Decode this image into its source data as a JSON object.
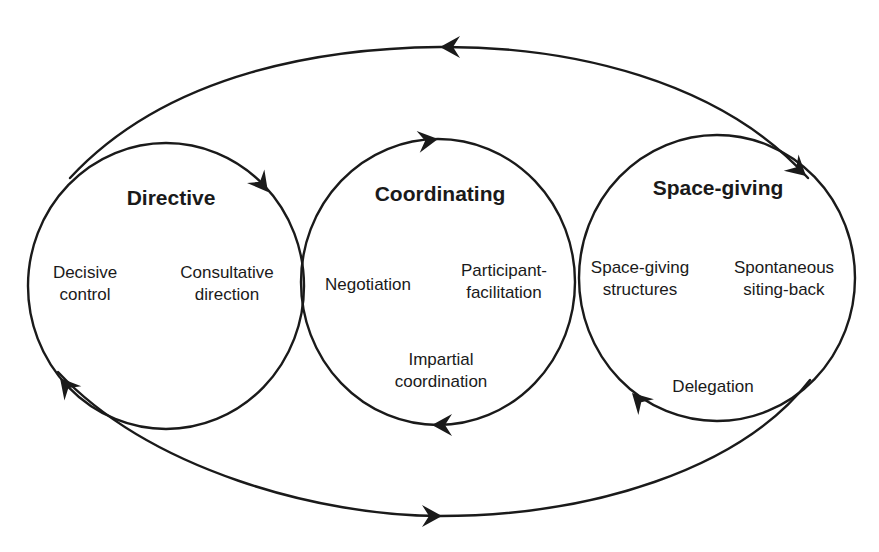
{
  "diagram": {
    "type": "leadership-style-cycle",
    "styles": [
      {
        "id": "directive",
        "title": "Directive",
        "items": [
          {
            "lines": [
              "Decisive",
              "control"
            ]
          },
          {
            "lines": [
              "Consultative",
              "direction"
            ]
          }
        ]
      },
      {
        "id": "coordinating",
        "title": "Coordinating",
        "items": [
          {
            "lines": [
              "Negotiation"
            ]
          },
          {
            "lines": [
              "Participant-",
              "facilitation"
            ]
          },
          {
            "lines": [
              "Impartial",
              "coordination"
            ]
          }
        ]
      },
      {
        "id": "space-giving",
        "title": "Space-giving",
        "items": [
          {
            "lines": [
              "Space-giving",
              "structures"
            ]
          },
          {
            "lines": [
              "Spontaneous",
              "siting-back"
            ]
          },
          {
            "lines": [
              "Delegation"
            ]
          }
        ]
      }
    ],
    "connections": [
      {
        "name": "directive-cycle-arrow",
        "from": "directive",
        "to": "directive",
        "direction": "clockwise"
      },
      {
        "name": "coordinating-cycle-arrow",
        "from": "coordinating",
        "to": "coordinating",
        "direction": "clockwise"
      },
      {
        "name": "space-giving-cycle-arrow",
        "from": "space-giving",
        "to": "space-giving",
        "direction": "clockwise"
      },
      {
        "name": "outer-top-arrow",
        "from": "directive",
        "to": "space-giving",
        "direction": "bidirectional"
      },
      {
        "name": "outer-bottom-arrow",
        "from": "space-giving",
        "to": "directive",
        "direction": "bidirectional"
      }
    ],
    "colors": {
      "line": "#1a1a1a",
      "text": "#1a1a1a",
      "background": "#ffffff"
    }
  }
}
